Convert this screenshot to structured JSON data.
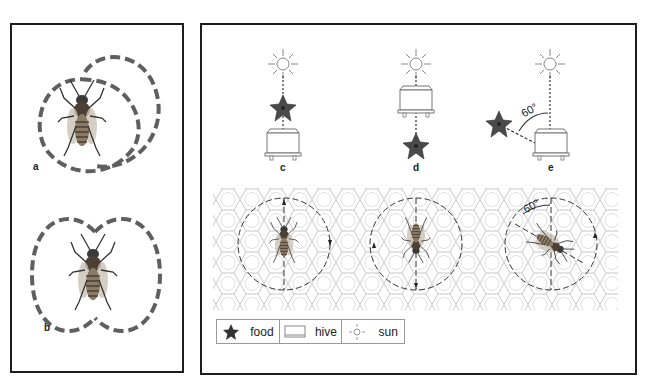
{
  "figure": {
    "panels": {
      "a": {
        "label": "a",
        "dance": "round dance"
      },
      "b": {
        "label": "b",
        "dance": "waggle dance (figure-eight)"
      },
      "c": {
        "label": "c",
        "arrangement": "sun, food, hive vertically aligned; food toward sun"
      },
      "d": {
        "label": "d",
        "arrangement": "sun, hive, food; food away from sun"
      },
      "e": {
        "label": "e",
        "arrangement": "food 60° left of sun direction",
        "angle": "60°"
      }
    },
    "comb": {
      "angle_label": "60°"
    },
    "legend": {
      "food": "food",
      "hive": "hive",
      "sun": "sun"
    }
  },
  "colors": {
    "dance_path": "#5f5f5f",
    "star": "#4a4a4a",
    "outline": "#1e1e1e",
    "comb": "#c8c8c8"
  }
}
